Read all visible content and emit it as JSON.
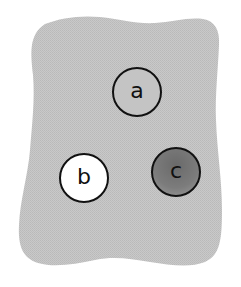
{
  "diagram": {
    "region": {
      "shape": "irregular-rounded-blob",
      "fill": "#c4c4c4",
      "texture": "dithered-gray"
    },
    "nodes": [
      {
        "id": "a",
        "label": "a",
        "fill": "#c4c4c4",
        "style": "unshaded",
        "center": [
          136,
          92
        ],
        "radius": 24
      },
      {
        "id": "b",
        "label": "b",
        "fill": "#ffffff",
        "style": "white",
        "center": [
          83,
          178
        ],
        "radius": 24
      },
      {
        "id": "c",
        "label": "c",
        "fill": "#7a7a7a",
        "style": "dark-shaded",
        "center": [
          175,
          172
        ],
        "radius": 24
      }
    ],
    "colors": {
      "outline": "#111111",
      "background": "#ffffff"
    }
  }
}
